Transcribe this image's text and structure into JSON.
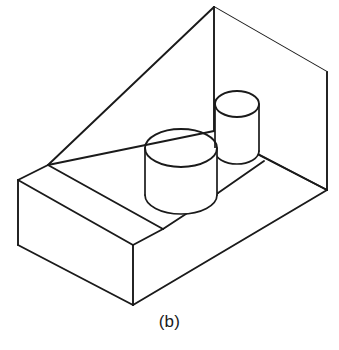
{
  "figure": {
    "caption": "(b)",
    "title": "Isometric pictorial of a stepped wedge block with two cylindrical bosses",
    "drawing_type": "isometric-line-drawing",
    "projection": "isometric",
    "line_color": "#1a1a1a",
    "background_color": "#ffffff",
    "line_width_px": 1.9,
    "canvas": {
      "width": 339,
      "height": 350
    },
    "parts": [
      {
        "name": "wedge-block-body",
        "description": "Rectangular base block with an inclined top face rising to a vertical back face"
      },
      {
        "name": "base-step-ledge",
        "description": "Low horizontal step / ledge along the left front of the base"
      },
      {
        "name": "large-cylinder-boss",
        "description": "Large upright cylindrical boss on the sloped interior floor"
      },
      {
        "name": "small-cylinder-boss",
        "description": "Small upright cylindrical boss behind and right of the large boss"
      }
    ],
    "geometry": {
      "outline_points": {
        "apex_top": [
          214,
          7
        ],
        "top_right_corner": [
          327,
          72
        ],
        "right_lower_corner": [
          327,
          190
        ],
        "bottom_right_corner": [
          216,
          255
        ],
        "front_bottom_corner": [
          133,
          305
        ],
        "front_upper_corner": [
          133,
          245
        ],
        "left_bottom_corner": [
          18,
          245
        ],
        "left_top_corner": [
          18,
          180
        ],
        "slope_foot": [
          48,
          165
        ],
        "back_mid_junction": [
          214,
          131
        ]
      },
      "large_cylinder": {
        "center_top": [
          181,
          148
        ],
        "rx": 36,
        "ry": 19,
        "height": 47
      },
      "small_cylinder": {
        "center_top": [
          237,
          104
        ],
        "rx": 22,
        "ry": 13,
        "height": 47
      }
    }
  }
}
